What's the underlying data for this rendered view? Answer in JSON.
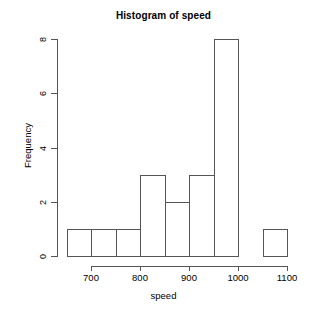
{
  "chart_data": {
    "type": "bar",
    "title": "Histogram of speed",
    "xlabel": "speed",
    "ylabel": "Frequency",
    "xlim": [
      650,
      1100
    ],
    "ylim": [
      0,
      8
    ],
    "grid": false,
    "legend": null,
    "bin_width": 50,
    "bin_edges": [
      650,
      700,
      750,
      800,
      850,
      900,
      950,
      1000,
      1050,
      1100
    ],
    "categories": [
      "650-700",
      "700-750",
      "750-800",
      "800-850",
      "850-900",
      "900-950",
      "950-1000",
      "1000-1050",
      "1050-1100"
    ],
    "values": [
      1,
      1,
      1,
      3,
      2,
      3,
      8,
      0,
      1
    ],
    "bars": [
      {
        "label": "650-700",
        "start": 650,
        "end": 700,
        "value": 1
      },
      {
        "label": "700-750",
        "start": 700,
        "end": 750,
        "value": 1
      },
      {
        "label": "750-800",
        "start": 750,
        "end": 800,
        "value": 1
      },
      {
        "label": "800-850",
        "start": 800,
        "end": 850,
        "value": 3
      },
      {
        "label": "850-900",
        "start": 850,
        "end": 900,
        "value": 2
      },
      {
        "label": "900-950",
        "start": 900,
        "end": 950,
        "value": 3
      },
      {
        "label": "950-1000",
        "start": 950,
        "end": 1000,
        "value": 8
      },
      {
        "label": "1000-1050",
        "start": 1000,
        "end": 1050,
        "value": 0
      },
      {
        "label": "1050-1100",
        "start": 1050,
        "end": 1100,
        "value": 1
      }
    ],
    "xticks": [
      700,
      800,
      900,
      1000,
      1100
    ],
    "xtick_labels": [
      "700",
      "800",
      "900",
      "1000",
      "1100"
    ],
    "yticks": [
      0,
      2,
      4,
      6,
      8
    ],
    "ytick_labels": [
      "0",
      "2",
      "4",
      "6",
      "8"
    ],
    "colors": {
      "background": "#ffffff",
      "axis": "#555555",
      "bar_border": "#555555",
      "bar_fill": "transparent",
      "text": "#000000"
    }
  }
}
